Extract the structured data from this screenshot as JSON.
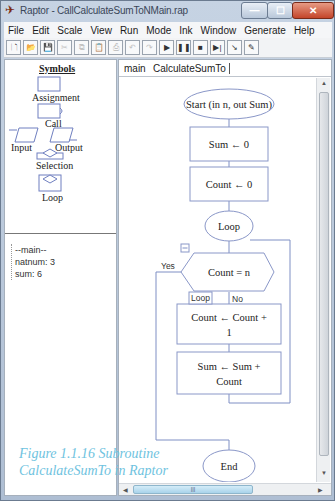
{
  "window": {
    "title": "Raptor - CallCalculateSumToNMain.rap",
    "controls": {
      "minimize": "—",
      "maximize": "☐",
      "close": "✕"
    }
  },
  "menu": [
    {
      "label": "File",
      "mnemonic": "F"
    },
    {
      "label": "Edit",
      "mnemonic": "E"
    },
    {
      "label": "Scale",
      "mnemonic": "S"
    },
    {
      "label": "View",
      "mnemonic": "V"
    },
    {
      "label": "Run",
      "mnemonic": "R"
    },
    {
      "label": "Mode",
      "mnemonic": "M"
    },
    {
      "label": "Ink",
      "mnemonic": "I"
    },
    {
      "label": "Window",
      "mnemonic": "W"
    },
    {
      "label": "Generate",
      "mnemonic": "G"
    },
    {
      "label": "Help",
      "mnemonic": "H"
    }
  ],
  "toolbar": [
    {
      "name": "new-file-icon",
      "glyph": "🗋",
      "disabled": false
    },
    {
      "name": "open-folder-icon",
      "glyph": "📂",
      "disabled": false
    },
    {
      "name": "save-icon",
      "glyph": "💾",
      "disabled": false
    },
    {
      "name": "cut-icon",
      "glyph": "✂",
      "disabled": true
    },
    {
      "name": "copy-icon",
      "glyph": "⧉",
      "disabled": true
    },
    {
      "name": "paste-icon",
      "glyph": "📋",
      "disabled": false
    },
    {
      "name": "print-icon",
      "glyph": "⎙",
      "disabled": true
    },
    {
      "name": "undo-icon",
      "glyph": "↶",
      "disabled": true
    },
    {
      "name": "redo-icon",
      "glyph": "↷",
      "disabled": true
    },
    {
      "name": "run-icon",
      "glyph": "▶",
      "disabled": false
    },
    {
      "name": "pause-icon",
      "glyph": "❚❚",
      "disabled": false
    },
    {
      "name": "stop-icon",
      "glyph": "■",
      "disabled": false
    },
    {
      "name": "step-icon",
      "glyph": "▶|",
      "disabled": false
    },
    {
      "name": "step-into-icon",
      "glyph": "↘",
      "disabled": false
    },
    {
      "name": "pen-icon",
      "glyph": "✎",
      "disabled": false
    }
  ],
  "symbols": {
    "title": "Symbols",
    "items": [
      "Assignment",
      "Call",
      "Input",
      "Output",
      "Selection",
      "Loop"
    ]
  },
  "variables": {
    "items": [
      "--main--",
      "natnum: 3",
      "sum: 6"
    ]
  },
  "tabs": [
    {
      "label": "main",
      "active": false
    },
    {
      "label": "CalculateSumTo",
      "active": true
    }
  ],
  "flowchart": {
    "start": "Start (in n, out Sum)",
    "assign1": "Sum ← 0",
    "assign2": "Count ← 0",
    "loop": "Loop",
    "condition": "Count = n",
    "yes_label": "Yes",
    "no_label": "No",
    "loop_tag": "Loop",
    "assign3_line1": "Count ← Count  +",
    "assign3_line2": "1",
    "assign4_line1": "Sum ← Sum  +",
    "assign4_line2": "Count",
    "end": "End"
  },
  "caption": "Figure 1.1.16 Subroutine\nCalculateSumTo in Raptor",
  "colors": {
    "flow_line": "#7f8fc4",
    "caption": "#6fc3e0",
    "close_button": "#c4452a"
  }
}
